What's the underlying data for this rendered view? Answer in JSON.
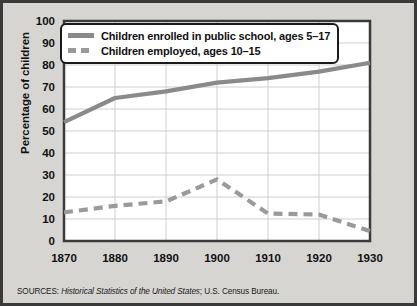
{
  "axes": {
    "ylabel": "Percentage of children",
    "yticks": [
      "100",
      "90",
      "80",
      "70",
      "60",
      "50",
      "40",
      "30",
      "20",
      "10",
      "0"
    ],
    "xticks": [
      "1870",
      "1880",
      "1890",
      "1900",
      "1910",
      "1920",
      "1930"
    ]
  },
  "legend": {
    "items": [
      {
        "label": "Children enrolled in public school, ages 5–17",
        "style": "solid"
      },
      {
        "label": "Children employed, ages 10–15",
        "style": "dashed"
      }
    ]
  },
  "source": {
    "prefix": "SOURCES: ",
    "title": "Historical Statistics of the United States",
    "suffix": "; U.S. Census Bureau."
  },
  "colors": {
    "enrolled_line": "#8a8a8a",
    "employed_line": "#9a9a9a",
    "grid": "#cfcfcf",
    "frame": "#3a3a3a",
    "plot_background": "#ffffff",
    "figure_background": "#d6d5d2"
  },
  "chart_data": {
    "type": "line",
    "title": "",
    "xlabel": "",
    "ylabel": "Percentage of children",
    "x": [
      1870,
      1880,
      1890,
      1900,
      1910,
      1920,
      1930
    ],
    "xlim": [
      1870,
      1930
    ],
    "ylim": [
      0,
      100
    ],
    "ytick_step": 10,
    "grid": true,
    "legend_position": "upper-left-inside",
    "series": [
      {
        "name": "Children enrolled in public school, ages 5–17",
        "style": "solid",
        "color": "#8a8a8a",
        "values": [
          54,
          65,
          68,
          72,
          74,
          77,
          81
        ]
      },
      {
        "name": "Children employed, ages 10–15",
        "style": "dashed",
        "color": "#9a9a9a",
        "values": [
          13,
          16,
          18,
          28,
          12.5,
          12,
          4.5
        ]
      }
    ]
  }
}
